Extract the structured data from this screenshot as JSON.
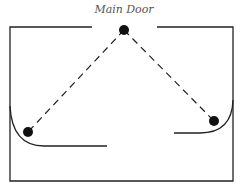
{
  "diagram": {
    "title_label": "Main Door",
    "colors": {
      "line": "#222222",
      "dot": "#111111",
      "label": "#555555"
    },
    "room": {
      "left": 10,
      "top": 27,
      "right": 233,
      "bottom": 181,
      "door_gap": [
        92,
        157
      ]
    },
    "nodes": [
      {
        "id": "door",
        "x": 124,
        "y": 30
      },
      {
        "id": "left-corner",
        "x": 28,
        "y": 132
      },
      {
        "id": "right-corner",
        "x": 214,
        "y": 121
      }
    ],
    "paths": [
      {
        "from": "door",
        "to": "left-corner",
        "style": "dashed"
      },
      {
        "from": "door",
        "to": "right-corner",
        "style": "dashed"
      }
    ]
  }
}
